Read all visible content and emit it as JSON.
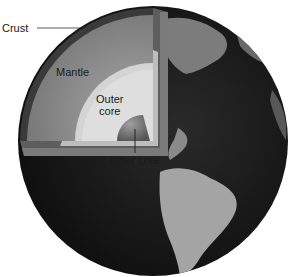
{
  "diagram": {
    "labels": {
      "crust": "Crust",
      "mantle": "Mantle",
      "outer_core_line1": "Outer",
      "outer_core_line2": "core",
      "inner_core": "Inner core"
    },
    "colors": {
      "background": "#ffffff",
      "crust": "#3a3a3a",
      "mantle": "#8c8c8c",
      "outer_core": "#d4d4d4",
      "inner_core": "#6e6e6e",
      "ocean": "#1c1c1c",
      "land": "#a8a8a8"
    }
  }
}
